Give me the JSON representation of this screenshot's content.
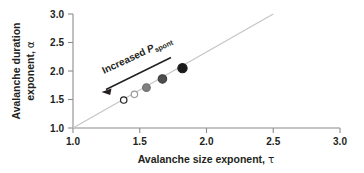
{
  "chart_data": {
    "type": "scatter",
    "title": "",
    "xlabel": "Avalanche size exponent, τ",
    "ylabel": "Avalanche duration exponent, α",
    "xlim": [
      1.0,
      3.0
    ],
    "ylim": [
      1.0,
      3.0
    ],
    "xticks": [
      "1.0",
      "1.5",
      "2.0",
      "2.5",
      "3.0"
    ],
    "yticks": [
      "1.0",
      "1.5",
      "2.0",
      "2.5",
      "3.0"
    ],
    "xtick_values": [
      1.0,
      1.5,
      2.0,
      2.5,
      3.0
    ],
    "ytick_values": [
      1.0,
      1.5,
      2.0,
      2.5,
      3.0
    ],
    "grid": false,
    "legend": "none",
    "series": [
      {
        "name": "Avalanche exponents vs spontaneous activity rate",
        "x": [
          1.38,
          1.46,
          1.55,
          1.67,
          1.82
        ],
        "y": [
          1.49,
          1.59,
          1.71,
          1.86,
          2.05
        ],
        "marker": "circle",
        "point_fills": [
          "#ffffff",
          "#ffffff",
          "#808080",
          "#4d4d4d",
          "#1a1a1a"
        ],
        "point_edges": [
          "#231f20",
          "#9a9a9a",
          "#6e6e6e",
          "#3f3f3f",
          "#1a1a1a"
        ],
        "point_radii": [
          3.2,
          3.2,
          3.8,
          4.2,
          4.6
        ]
      }
    ],
    "reference_line": {
      "name": "identity-line",
      "x": [
        1.0,
        2.5
      ],
      "y": [
        1.0,
        3.0
      ],
      "color": "#c7c7c7",
      "width": 1.4
    },
    "annotations": [
      {
        "name": "increased-pspont",
        "text_prefix": "Increased ",
        "text_symbol": "P",
        "text_subscript": "spont",
        "rotation_deg": -25,
        "arrow_from": [
          1.72,
          2.22
        ],
        "arrow_to": [
          1.17,
          1.5
        ],
        "arrow_color": "#231f20"
      }
    ]
  },
  "axes": {
    "x_title": "Avalanche size exponent, τ",
    "y_title": "Avalanche duration exponent, α",
    "x_title_main": "Avalanche size exponent,",
    "x_title_greek": "τ",
    "y_title_line1": "Avalanche duration",
    "y_title_line2": "exponent,",
    "y_title_greek": "α",
    "x_tick_labels": [
      "1.0",
      "1.5",
      "2.0",
      "2.5",
      "3.0"
    ],
    "y_tick_labels": [
      "1.0",
      "1.5",
      "2.0",
      "2.5",
      "3.0"
    ],
    "axis_color": "#8c8c8c"
  },
  "annotation": {
    "label_prefix": "Increased ",
    "label_symbol": "P",
    "label_subscript": "spont"
  },
  "colors": {
    "axis": "#8c8c8c",
    "text": "#231f20",
    "reference_line": "#c7c7c7",
    "background": "#ffffff"
  }
}
